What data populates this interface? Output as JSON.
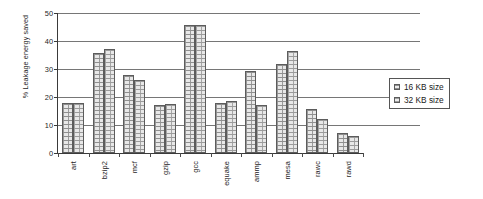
{
  "chart_data": {
    "type": "bar",
    "title": "",
    "xlabel": "",
    "ylabel": "% Leakage energy saved",
    "ylim": [
      0,
      50
    ],
    "yticks": [
      0,
      10,
      20,
      30,
      40,
      50
    ],
    "grid": true,
    "legend_position": "right",
    "categories": [
      "art",
      "bzip2",
      "mcf",
      "gzip",
      "gcc",
      "equake",
      "ammp",
      "mesa",
      "rawc",
      "rawd"
    ],
    "series": [
      {
        "name": "16 KB size",
        "values": [
          17.8,
          35.6,
          27.8,
          17.0,
          45.8,
          17.8,
          29.4,
          31.7,
          15.6,
          7.1
        ]
      },
      {
        "name": "32 KB size",
        "values": [
          17.9,
          37.3,
          25.9,
          17.6,
          45.6,
          18.7,
          17.1,
          36.4,
          12.1,
          6.2
        ]
      }
    ]
  },
  "legend": {
    "items": [
      {
        "label": "16 KB size"
      },
      {
        "label": "32 KB size"
      }
    ]
  }
}
